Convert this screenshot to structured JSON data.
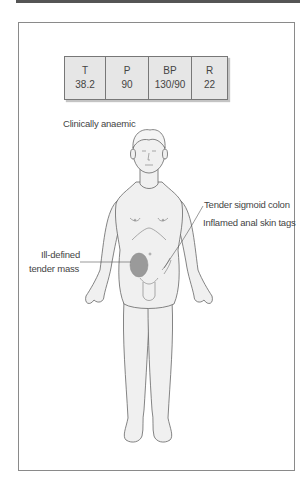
{
  "figure": {
    "vitals": [
      {
        "label": "T",
        "value": "38.2"
      },
      {
        "label": "P",
        "value": "90"
      },
      {
        "label": "BP",
        "value": "130/90"
      },
      {
        "label": "R",
        "value": "22"
      }
    ],
    "annotations": {
      "general": "Clinically anaemic",
      "sigmoid": "Tender sigmoid colon",
      "anal": "Inflamed anal skin tags",
      "mass_line1": "Ill-defined",
      "mass_line2": "tender mass"
    },
    "colors": {
      "mass_fill": "#9a9a9a",
      "body_fill": "#f0f0f0",
      "outline": "#666666",
      "vitals_bg": "#e6e6e6"
    }
  }
}
